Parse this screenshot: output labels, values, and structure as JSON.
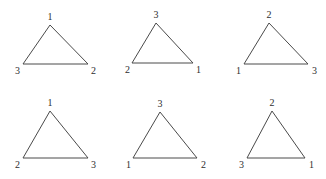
{
  "figure": {
    "background_color": "#ffffff",
    "stroke_color": "#4a4a4a",
    "label_color": "#2e2e2e",
    "rows": 2,
    "columns": 3,
    "triangles": [
      {
        "id": "triangle-1",
        "row": 0,
        "column": 0,
        "apex_label": "1",
        "bottom_left_label": "3",
        "bottom_right_label": "2"
      },
      {
        "id": "triangle-2",
        "row": 0,
        "column": 1,
        "apex_label": "3",
        "bottom_left_label": "2",
        "bottom_right_label": "1"
      },
      {
        "id": "triangle-3",
        "row": 0,
        "column": 2,
        "apex_label": "2",
        "bottom_left_label": "1",
        "bottom_right_label": "3"
      },
      {
        "id": "triangle-4",
        "row": 1,
        "column": 0,
        "apex_label": "1",
        "bottom_left_label": "2",
        "bottom_right_label": "3"
      },
      {
        "id": "triangle-5",
        "row": 1,
        "column": 1,
        "apex_label": "3",
        "bottom_left_label": "1",
        "bottom_right_label": "2"
      },
      {
        "id": "triangle-6",
        "row": 1,
        "column": 2,
        "apex_label": "2",
        "bottom_left_label": "3",
        "bottom_right_label": "1"
      }
    ]
  }
}
